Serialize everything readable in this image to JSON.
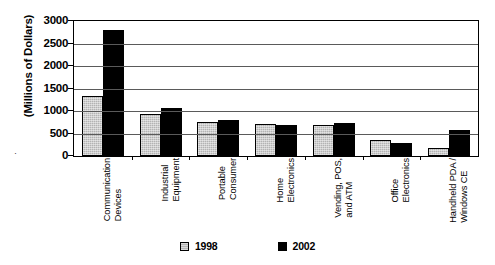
{
  "chart_data": {
    "type": "bar",
    "title": "",
    "xlabel": "",
    "ylabel": "(Millions of Dollars)",
    "ylim": [
      0,
      3000
    ],
    "yticks": [
      0,
      500,
      1000,
      1500,
      2000,
      2500,
      3000
    ],
    "ytick_labels": [
      "0",
      "500",
      "1000",
      "1500",
      "2000",
      "2500",
      "3000"
    ],
    "grid": true,
    "legend_position": "bottom",
    "categories": [
      "Communication Devices",
      "Industrial Equipment",
      "Portable Consumer",
      "Home Electronics",
      "Vending, POS, and ATM",
      "Office Electronics",
      "Handheld PDA / Windows CE"
    ],
    "category_lines": [
      [
        "Communication",
        "Devices"
      ],
      [
        "Industrial",
        "Equipment"
      ],
      [
        "Portable",
        "Consumer"
      ],
      [
        "Home",
        "Electronics"
      ],
      [
        "Vending, POS,",
        "and ATM"
      ],
      [
        "Office",
        "Electronics"
      ],
      [
        "Handheld PDA /",
        "Windows CE"
      ]
    ],
    "series": [
      {
        "name": "1998",
        "color": "#b3b3b3",
        "values": [
          1330,
          940,
          760,
          710,
          680,
          350,
          180
        ]
      },
      {
        "name": "2002",
        "color": "#000000",
        "values": [
          2790,
          1060,
          800,
          700,
          730,
          280,
          580
        ]
      }
    ]
  },
  "legend": {
    "items": [
      {
        "label": "1998",
        "swatch": "light-gray-square"
      },
      {
        "label": "2002",
        "swatch": "black-square"
      }
    ]
  },
  "axis": {
    "y_title": "(Millions of Dollars)"
  }
}
